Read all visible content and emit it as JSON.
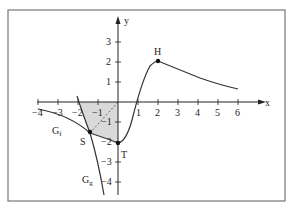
{
  "diagram": {
    "axes": {
      "x_label": "x",
      "y_label": "y"
    },
    "x_ticks": [
      "−4",
      "−3",
      "−2",
      "−1",
      "1",
      "2",
      "3",
      "4",
      "5",
      "6"
    ],
    "y_ticks": [
      "3",
      "2",
      "1",
      "−1",
      "−2",
      "−3",
      "−4"
    ],
    "graphs": {
      "f": "G",
      "f_sub": "f",
      "g": "G",
      "g_sub": "g"
    },
    "points": {
      "H": "H",
      "S": "S",
      "T": "T"
    },
    "colors": {
      "shade": "#d9d9d9",
      "curve": "#333333",
      "frame": "#777777"
    }
  }
}
